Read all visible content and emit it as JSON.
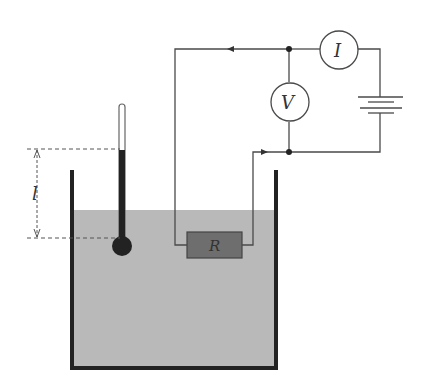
{
  "diagram": {
    "labels": {
      "length": "l",
      "resistor": "R",
      "voltmeter": "V",
      "ammeter": "I"
    },
    "components": [
      {
        "name": "container",
        "description": "open-top vessel filled with liquid"
      },
      {
        "name": "liquid",
        "description": "shaded liquid in container"
      },
      {
        "name": "thermometer",
        "description": "bulb thermometer in liquid"
      },
      {
        "name": "resistor",
        "label": "R"
      },
      {
        "name": "voltmeter",
        "label": "V"
      },
      {
        "name": "ammeter",
        "label": "I"
      },
      {
        "name": "battery",
        "description": "DC source"
      }
    ],
    "colors": {
      "liquid": "#b9b9b9",
      "container": "#222222",
      "wire": "#4a4a4a",
      "resistor": "#6e6e6e"
    }
  }
}
